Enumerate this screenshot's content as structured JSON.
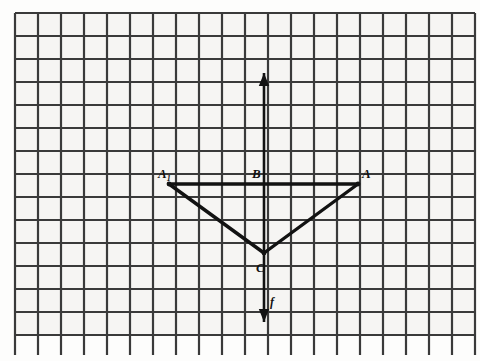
{
  "figure": {
    "kind": "geometry-grid-diagram",
    "background_color": "#fdfdfc",
    "grid": {
      "cell_color": "#f6f5f3",
      "line_color": "#3a3a3a",
      "line_width": 2.2,
      "cell_size": 23,
      "origin_x": 15,
      "origin_y": 13,
      "columns": 20,
      "rows": 14,
      "stub_bottom_y": 355,
      "note": "square grid, bottom vertical rulings extend past last horizontal line"
    },
    "stroke_color": "#121212",
    "shape_line_width": 3.4,
    "axis_line_width": 2.6
  },
  "chart_data": {
    "type": "scatter",
    "title": "",
    "xlabel": "",
    "ylabel": "",
    "grid": true,
    "legend": "none",
    "points": [
      {
        "label": "A₁",
        "label_text": "A",
        "subscript": "1",
        "x": 169,
        "y": 184
      },
      {
        "label": "B",
        "label_text": "B",
        "subscript": "",
        "x": 264,
        "y": 184
      },
      {
        "label": "A",
        "label_text": "A",
        "subscript": "",
        "x": 358,
        "y": 184
      },
      {
        "label": "C",
        "label_text": "C",
        "subscript": "",
        "x": 264,
        "y": 253
      }
    ],
    "segments": [
      {
        "name": "A1-A",
        "from": "A₁",
        "to": "A"
      },
      {
        "name": "A1-C",
        "from": "A₁",
        "to": "C"
      },
      {
        "name": "A-C",
        "from": "A",
        "to": "C"
      }
    ],
    "lines": [
      {
        "name": "f",
        "label": "f",
        "orientation": "vertical",
        "x": 264,
        "y_top": 73,
        "y_bottom": 322,
        "arrow_top": true,
        "arrow_bottom": true
      }
    ]
  },
  "labels": {
    "a_reflected": {
      "base": "A",
      "sub": "1",
      "x": 158,
      "y": 178
    },
    "b": {
      "text": "B",
      "x": 252,
      "y": 178
    },
    "a": {
      "text": "A",
      "x": 362,
      "y": 178
    },
    "c": {
      "text": "C",
      "x": 256,
      "y": 272
    },
    "f": {
      "text": "f",
      "x": 270,
      "y": 306
    }
  }
}
